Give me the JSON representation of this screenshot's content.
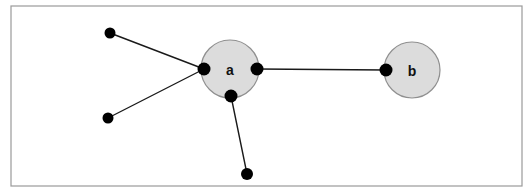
{
  "figure": {
    "width": 532,
    "height": 195,
    "background_color": "#ffffff"
  },
  "frame": {
    "name": "figure-border",
    "x": 11,
    "y": 6,
    "width": 511,
    "height": 180,
    "stroke_color": "#9a9a9a",
    "stroke_width": 1.2,
    "fill": "none"
  },
  "style": {
    "node_fill": "#dcdcdc",
    "node_stroke": "#8f8f8f",
    "node_stroke_width": 1.2,
    "edge_color": "#1a1a1a",
    "edge_width": 1.4,
    "dot_color": "#000000",
    "label_color": "#111111",
    "label_font_size": 14
  },
  "nodes": [
    {
      "id": "a",
      "label": "a",
      "cx": 230,
      "cy": 69,
      "r": 29,
      "font_size": 14
    },
    {
      "id": "b",
      "label": "b",
      "cx": 412,
      "cy": 70,
      "r": 28,
      "font_size": 14
    }
  ],
  "ports": [
    {
      "id": "a-left",
      "owner": "a",
      "cx": 204,
      "cy": 69,
      "r": 6.5
    },
    {
      "id": "a-right",
      "owner": "a",
      "cx": 257,
      "cy": 69,
      "r": 6.5
    },
    {
      "id": "a-bottom",
      "owner": "a",
      "cx": 231,
      "cy": 96,
      "r": 6.5
    },
    {
      "id": "b-left",
      "owner": "b",
      "cx": 386,
      "cy": 70,
      "r": 6.5
    }
  ],
  "leaf_dots": [
    {
      "id": "leaf-top-left",
      "cx": 110,
      "cy": 33,
      "r": 5.5
    },
    {
      "id": "leaf-bottom-left",
      "cx": 108,
      "cy": 118,
      "r": 5.5
    },
    {
      "id": "leaf-bottom",
      "cx": 247,
      "cy": 174,
      "r": 6.0
    }
  ],
  "edges": [
    {
      "id": "edge-leaf-top-left-to-a",
      "x1": 110,
      "y1": 33,
      "x2": 204,
      "y2": 69
    },
    {
      "id": "edge-leaf-bottom-left-to-a",
      "x1": 108,
      "y1": 118,
      "x2": 204,
      "y2": 69
    },
    {
      "id": "edge-a-to-leaf-bottom",
      "x1": 231,
      "y1": 96,
      "x2": 247,
      "y2": 174
    },
    {
      "id": "edge-a-to-b",
      "x1": 257,
      "y1": 69,
      "x2": 386,
      "y2": 70
    }
  ],
  "chart_data": {
    "type": "diagram",
    "node_labels": [
      "a",
      "b"
    ],
    "node_count": 2,
    "leaf_dot_count": 3,
    "edge_count": 4,
    "adjacency": [
      {
        "from": "leaf-top-left",
        "to": "a"
      },
      {
        "from": "leaf-bottom-left",
        "to": "a"
      },
      {
        "from": "a",
        "to": "leaf-bottom"
      },
      {
        "from": "a",
        "to": "b"
      }
    ],
    "degree": {
      "a": 4,
      "b": 1
    }
  }
}
